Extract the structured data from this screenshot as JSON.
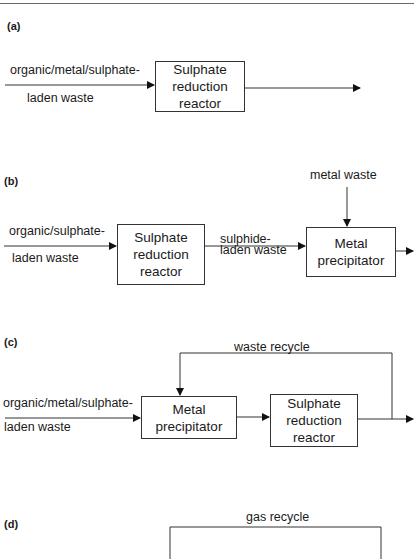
{
  "diagram": {
    "panels": [
      {
        "id": "a",
        "label": "(a)",
        "input_label_line1": "organic/metal/sulphate-",
        "input_label_line2": "laden waste",
        "boxes": [
          {
            "text": "Sulphate\nreduction\nreactor"
          }
        ]
      },
      {
        "id": "b",
        "label": "(b)",
        "input_label_line1": "organic/sulphate-",
        "input_label_line2": "laden waste",
        "side_input_label": "metal waste",
        "intermediate_label_line1": "sulphide-",
        "intermediate_label_line2": "laden waste",
        "boxes": [
          {
            "text": "Sulphate\nreduction\nreactor"
          },
          {
            "text": "Metal\nprecipitator"
          }
        ]
      },
      {
        "id": "c",
        "label": "(c)",
        "input_label_line1": "organic/metal/sulphate-",
        "input_label_line2": "laden waste",
        "recycle_label": "waste recycle",
        "boxes": [
          {
            "text": "Metal\nprecipitator"
          },
          {
            "text": "Sulphate\nreduction\nreactor"
          }
        ]
      },
      {
        "id": "d",
        "label": "(d)",
        "recycle_label": "gas recycle"
      }
    ]
  }
}
